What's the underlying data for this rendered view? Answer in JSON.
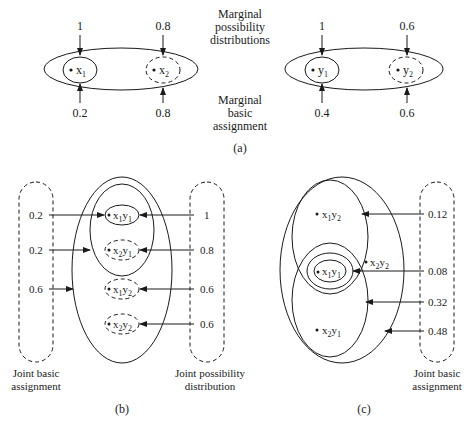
{
  "panel_a": {
    "caption": "(a)",
    "center_labels": {
      "top": [
        "Marginal",
        "possibility",
        "distributions"
      ],
      "bottom": [
        "Marginal",
        "basic",
        "assignment"
      ]
    },
    "x_set": {
      "elements": [
        {
          "var": "x",
          "sub": "1",
          "possibility": "1",
          "basic_assignment": "0.2",
          "focal_style": "solid"
        },
        {
          "var": "x",
          "sub": "2",
          "possibility": "0.8",
          "basic_assignment": "0.8",
          "focal_style": "dashed"
        }
      ]
    },
    "y_set": {
      "elements": [
        {
          "var": "y",
          "sub": "1",
          "possibility": "1",
          "basic_assignment": "0.4",
          "focal_style": "solid"
        },
        {
          "var": "y",
          "sub": "2",
          "possibility": "0.6",
          "basic_assignment": "0.6",
          "focal_style": "dashed"
        }
      ]
    }
  },
  "panel_b": {
    "caption": "(b)",
    "left_caption": [
      "Joint basic",
      "assignment"
    ],
    "right_caption": [
      "Joint possibility",
      "distribution"
    ],
    "left_values": [
      "0.2",
      "0.2",
      "0.6"
    ],
    "right_values": [
      "1",
      "0.8",
      "0.6",
      "0.6"
    ],
    "elements": [
      {
        "a": "x",
        "as": "1",
        "b": "y",
        "bs": "1"
      },
      {
        "a": "x",
        "as": "2",
        "b": "y",
        "bs": "1"
      },
      {
        "a": "x",
        "as": "1",
        "b": "y",
        "bs": "2"
      },
      {
        "a": "x",
        "as": "2",
        "b": "y",
        "bs": "2"
      }
    ]
  },
  "panel_c": {
    "caption": "(c)",
    "right_caption": [
      "Joint basic",
      "assignment"
    ],
    "right_values": [
      "0.12",
      "0.08",
      "0.32",
      "0.48"
    ],
    "elements": [
      {
        "a": "x",
        "as": "1",
        "b": "y",
        "bs": "2"
      },
      {
        "a": "x",
        "as": "1",
        "b": "y",
        "bs": "1"
      },
      {
        "a": "x",
        "as": "2",
        "b": "y",
        "bs": "2"
      },
      {
        "a": "x",
        "as": "2",
        "b": "y",
        "bs": "1"
      }
    ]
  }
}
